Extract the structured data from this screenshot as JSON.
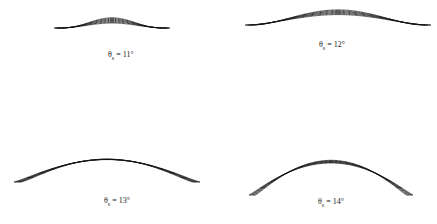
{
  "panels": [
    {
      "id": "p11",
      "symbol": "θ",
      "subscript": "s",
      "value": "= 11°"
    },
    {
      "id": "p12",
      "symbol": "θ",
      "subscript": "s",
      "value": "= 12°"
    },
    {
      "id": "p13",
      "symbol": "θ",
      "subscript": "s",
      "value": "= 13°"
    },
    {
      "id": "p14",
      "symbol": "θ",
      "subscript": "s",
      "value": "= 14°"
    }
  ]
}
